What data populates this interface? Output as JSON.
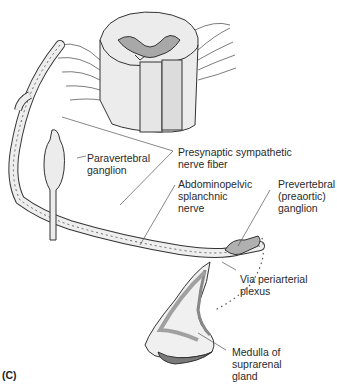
{
  "figure": {
    "panel_label": "(C)",
    "labels": {
      "presynaptic": [
        "Presynaptic sympathetic",
        "nerve fiber"
      ],
      "paravertebral": [
        "Paravertebral",
        "ganglion"
      ],
      "abdominopelvic": [
        "Abdominopelvic",
        "splanchnic",
        "nerve"
      ],
      "prevertebral": [
        "Prevertebral",
        "(preaortic)",
        "ganglion"
      ],
      "periarterial": [
        "Via periarterial",
        "plexus"
      ],
      "medulla": [
        "Medulla of",
        "suprarenal",
        "gland"
      ]
    },
    "colors": {
      "outline": "#333333",
      "fill_light": "#f0f0f0",
      "fill_grey": "#b5b5b5",
      "fill_dark": "#8a8a8a"
    }
  }
}
